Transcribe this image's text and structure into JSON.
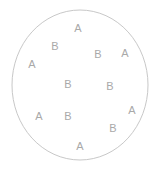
{
  "figure": {
    "name": "scatter-of-labels-in-circle",
    "width": 166,
    "height": 171,
    "background_color": "#ffffff"
  },
  "circle": {
    "name": "boundary-circle",
    "center_x": 80,
    "center_y": 85,
    "radius_x": 68,
    "radius_y": 75,
    "stroke_color": "#c8c8c8",
    "stroke_width": 1,
    "fill": "none"
  },
  "chart_data": {
    "type": "scatter",
    "title": "",
    "subtitle": "",
    "xlabel": "",
    "ylabel": "",
    "grid": false,
    "legend": "none",
    "axes_visible": false,
    "xlim": [
      0,
      166
    ],
    "ylim": [
      0,
      171
    ],
    "label_color": "#a9a9a9",
    "categories": [
      "A",
      "B"
    ],
    "counts": {
      "A": 6,
      "B": 6
    },
    "total_points": 12,
    "points": [
      {
        "label": "A",
        "x": 78,
        "y": 28
      },
      {
        "label": "B",
        "x": 55,
        "y": 46
      },
      {
        "label": "B",
        "x": 98,
        "y": 54
      },
      {
        "label": "A",
        "x": 125,
        "y": 53
      },
      {
        "label": "A",
        "x": 32,
        "y": 64
      },
      {
        "label": "B",
        "x": 68,
        "y": 84
      },
      {
        "label": "B",
        "x": 110,
        "y": 86
      },
      {
        "label": "A",
        "x": 132,
        "y": 110
      },
      {
        "label": "A",
        "x": 39,
        "y": 116
      },
      {
        "label": "B",
        "x": 68,
        "y": 116
      },
      {
        "label": "B",
        "x": 113,
        "y": 128
      },
      {
        "label": "A",
        "x": 80,
        "y": 146
      }
    ]
  }
}
